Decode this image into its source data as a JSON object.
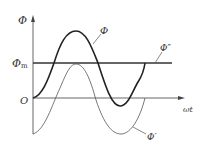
{
  "diagram": {
    "y_axis_label": "Φ",
    "x_axis_label": "ωt",
    "origin_label": "O",
    "level_label": "Φ",
    "level_label_sub": "m",
    "curves": [
      {
        "name": "Φ",
        "label": "Φ",
        "style": "bold",
        "description": "total flux, starts at O, peaks above Φm"
      },
      {
        "name": "Φ''",
        "label": "Φ″",
        "style": "horizontal line",
        "description": "constant component at Φm"
      },
      {
        "name": "Φ'",
        "label": "Φ′",
        "style": "thin",
        "description": "sinusoidal component, starts at -Φm"
      }
    ],
    "colors": {
      "stroke": "#333333",
      "axis": "#666666",
      "background": "#ffffff"
    }
  }
}
